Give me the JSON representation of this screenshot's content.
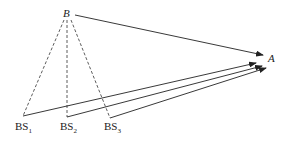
{
  "diagram": {
    "nodes": {
      "B": {
        "label": "B"
      },
      "A": {
        "label": "A"
      },
      "BS1": {
        "label": "BS",
        "sub": "1"
      },
      "BS2": {
        "label": "BS",
        "sub": "2"
      },
      "BS3": {
        "label": "BS",
        "sub": "3"
      }
    },
    "edges": [
      {
        "from": "B",
        "to": "A",
        "style": "solid-arrow"
      },
      {
        "from": "BS1",
        "to": "A",
        "style": "solid-arrow"
      },
      {
        "from": "BS2",
        "to": "A",
        "style": "solid-arrow"
      },
      {
        "from": "BS3",
        "to": "A",
        "style": "solid-arrow"
      },
      {
        "from": "B",
        "to": "BS1",
        "style": "dashed"
      },
      {
        "from": "B",
        "to": "BS2",
        "style": "dashed"
      },
      {
        "from": "B",
        "to": "BS3",
        "style": "dashed"
      }
    ],
    "colors": {
      "line": "#222222",
      "background": "#ffffff"
    }
  }
}
